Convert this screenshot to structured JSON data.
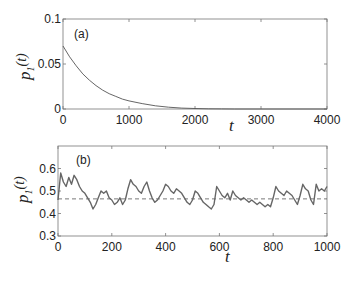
{
  "chart_data": [
    {
      "type": "line",
      "panel_label": "(a)",
      "title": "",
      "xlabel": "t",
      "ylabel": "p_1(t)",
      "ylabel_main": "p",
      "ylabel_sub": "1",
      "ylabel_arg": "(t)",
      "xlim": [
        0,
        4000
      ],
      "ylim": [
        0,
        0.1
      ],
      "xticks": [
        "0",
        "1000",
        "2000",
        "3000",
        "4000"
      ],
      "yticks": [
        "0",
        "0.05",
        "0.1"
      ],
      "grid": false,
      "series": [
        {
          "name": "p1(t) decay",
          "color": "#555555",
          "x": [
            0,
            100,
            200,
            300,
            400,
            500,
            600,
            700,
            800,
            900,
            1000,
            1200,
            1400,
            1600,
            1800,
            2000,
            2200,
            2400,
            2600
          ],
          "y": [
            0.07,
            0.058,
            0.048,
            0.039,
            0.032,
            0.026,
            0.021,
            0.017,
            0.014,
            0.011,
            0.009,
            0.006,
            0.0035,
            0.002,
            0.001,
            0.0005,
            0.0002,
            0.0001,
            0.0
          ]
        }
      ]
    },
    {
      "type": "line",
      "panel_label": "(b)",
      "title": "",
      "xlabel": "t",
      "ylabel": "p_1(t)",
      "ylabel_main": "p",
      "ylabel_sub": "1",
      "ylabel_arg": "(t)",
      "xlim": [
        0,
        1000
      ],
      "ylim": [
        0.3,
        0.7
      ],
      "xticks": [
        "0",
        "200",
        "400",
        "600",
        "800",
        "1000"
      ],
      "yticks": [
        "0.3",
        "0.4",
        "0.5",
        "0.6"
      ],
      "grid": false,
      "reference_line": {
        "y": 0.465,
        "style": "dashed",
        "color": "#555555"
      },
      "series": [
        {
          "name": "p1(t) fluctuating",
          "color": "#666666",
          "x": [
            0,
            10,
            20,
            30,
            40,
            50,
            60,
            70,
            80,
            90,
            100,
            110,
            120,
            130,
            140,
            150,
            160,
            170,
            180,
            190,
            200,
            210,
            220,
            230,
            240,
            250,
            260,
            270,
            280,
            290,
            300,
            310,
            320,
            330,
            340,
            350,
            360,
            370,
            380,
            390,
            400,
            410,
            420,
            430,
            440,
            450,
            460,
            470,
            480,
            490,
            500,
            510,
            520,
            530,
            540,
            550,
            560,
            570,
            580,
            590,
            600,
            610,
            620,
            630,
            640,
            650,
            660,
            670,
            680,
            690,
            700,
            710,
            720,
            730,
            740,
            750,
            760,
            770,
            780,
            790,
            800,
            810,
            820,
            830,
            840,
            850,
            860,
            870,
            880,
            890,
            900,
            910,
            920,
            930,
            940,
            950,
            960,
            970,
            980,
            990,
            1000
          ],
          "y": [
            0.46,
            0.58,
            0.54,
            0.52,
            0.56,
            0.53,
            0.57,
            0.55,
            0.52,
            0.5,
            0.49,
            0.47,
            0.45,
            0.42,
            0.44,
            0.47,
            0.5,
            0.49,
            0.5,
            0.47,
            0.46,
            0.44,
            0.45,
            0.47,
            0.44,
            0.46,
            0.51,
            0.55,
            0.53,
            0.52,
            0.5,
            0.49,
            0.52,
            0.54,
            0.5,
            0.47,
            0.45,
            0.46,
            0.48,
            0.5,
            0.53,
            0.52,
            0.5,
            0.49,
            0.51,
            0.5,
            0.49,
            0.47,
            0.45,
            0.44,
            0.46,
            0.5,
            0.49,
            0.47,
            0.45,
            0.44,
            0.43,
            0.42,
            0.44,
            0.52,
            0.5,
            0.48,
            0.47,
            0.49,
            0.46,
            0.5,
            0.48,
            0.47,
            0.46,
            0.47,
            0.46,
            0.45,
            0.46,
            0.45,
            0.44,
            0.45,
            0.44,
            0.43,
            0.44,
            0.43,
            0.47,
            0.52,
            0.5,
            0.49,
            0.48,
            0.5,
            0.49,
            0.48,
            0.46,
            0.44,
            0.48,
            0.53,
            0.51,
            0.5,
            0.46,
            0.44,
            0.53,
            0.5,
            0.51,
            0.5,
            0.52
          ]
        }
      ]
    }
  ]
}
